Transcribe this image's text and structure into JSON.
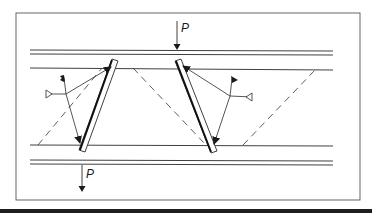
{
  "diagram": {
    "type": "weld-joint-schematic",
    "labels": {
      "load_top": "P",
      "load_bottom": "P"
    },
    "colors": {
      "stroke": "#2a2a2a",
      "frame": "#555555",
      "background": "#ffffff",
      "bottom_rule": "#1e1e1e"
    },
    "elements": {
      "frame": "rectangular border",
      "top_flange": "double horizontal line",
      "bottom_flange": "double horizontal line",
      "inner_lines": [
        "upper inner line",
        "lower inner line"
      ],
      "plates": [
        "left inclined plate",
        "right inclined plate"
      ],
      "dashed_lines": 3,
      "weld_symbols": [
        "left fillet weld symbol",
        "right fillet weld symbol"
      ],
      "load_arrows": [
        "top load P downward",
        "bottom load P downward"
      ]
    }
  }
}
